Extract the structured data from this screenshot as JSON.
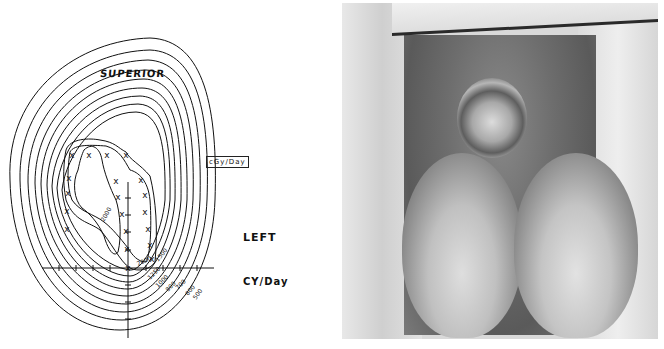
{
  "figure_left": {
    "type": "isodose-diagram",
    "labels": {
      "superior": "SUPERIOR",
      "left": "LEFT",
      "unit": "CY/Day",
      "unit_box": "cGy/Day",
      "inner_contour": "2000"
    },
    "contour_labels": [
      "2000",
      "1500",
      "1250",
      "1000",
      "800",
      "700",
      "600",
      "500",
      "400"
    ],
    "marker_symbol": "X",
    "marker_count": 20,
    "contour_count": 11
  },
  "figure_right": {
    "type": "clinical-photograph",
    "tone": "grayscale"
  }
}
